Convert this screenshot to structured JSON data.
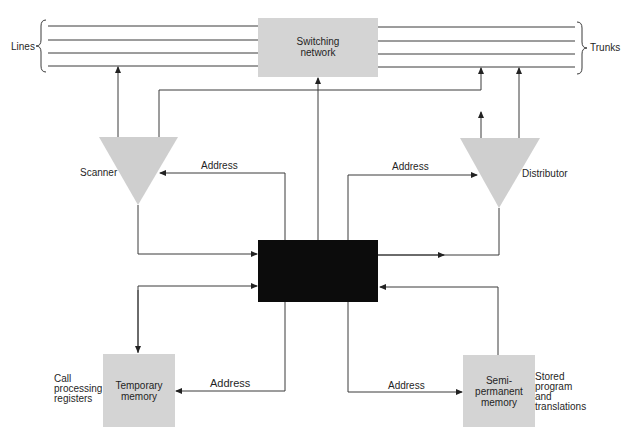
{
  "diagram": {
    "title": "",
    "colors": {
      "gray_block": "#d4d4d4",
      "central_block": "#0c0c0c",
      "line": "#3a3a3a",
      "background": "#ffffff"
    },
    "labels": {
      "lines": "Lines",
      "trunks": "Trunks",
      "scanner": "Scanner",
      "distributor": "Distributor",
      "address_scanner": "Address",
      "address_distributor": "Address",
      "address_temp": "Address",
      "address_semi": "Address",
      "call_processing": [
        "Call",
        "processing",
        "registers"
      ],
      "stored_program": [
        "Stored",
        "program",
        "and",
        "translations"
      ]
    },
    "blocks": {
      "switching_network": [
        "Switching",
        "network"
      ],
      "temporary_memory": [
        "Temporary",
        "memory"
      ],
      "semipermanent_memory": [
        "Semi-",
        "permanent",
        "memory"
      ],
      "central_control": ""
    },
    "nodes": [
      {
        "id": "switching_network",
        "shape": "rect"
      },
      {
        "id": "scanner",
        "shape": "triangle-down"
      },
      {
        "id": "distributor",
        "shape": "triangle-down"
      },
      {
        "id": "central_control",
        "shape": "rect-black"
      },
      {
        "id": "temporary_memory",
        "shape": "rect"
      },
      {
        "id": "semipermanent_memory",
        "shape": "rect"
      }
    ],
    "edges": [
      {
        "from": "scanner",
        "to": "lines"
      },
      {
        "from": "scanner",
        "to": "trunks"
      },
      {
        "from": "central_control",
        "to": "switching_network"
      },
      {
        "from": "distributor",
        "to": "trunks"
      },
      {
        "from": "central_control",
        "to": "scanner",
        "label": "Address"
      },
      {
        "from": "central_control",
        "to": "distributor",
        "label": "Address"
      },
      {
        "from": "scanner",
        "to": "central_control"
      },
      {
        "from": "distributor",
        "to": "central_control"
      },
      {
        "from": "central_control",
        "to": "temporary_memory"
      },
      {
        "from": "temporary_memory",
        "to": "central_control"
      },
      {
        "from": "central_control",
        "to": "temporary_memory",
        "label": "Address"
      },
      {
        "from": "central_control",
        "to": "semipermanent_memory",
        "label": "Address"
      },
      {
        "from": "semipermanent_memory",
        "to": "central_control"
      }
    ]
  }
}
